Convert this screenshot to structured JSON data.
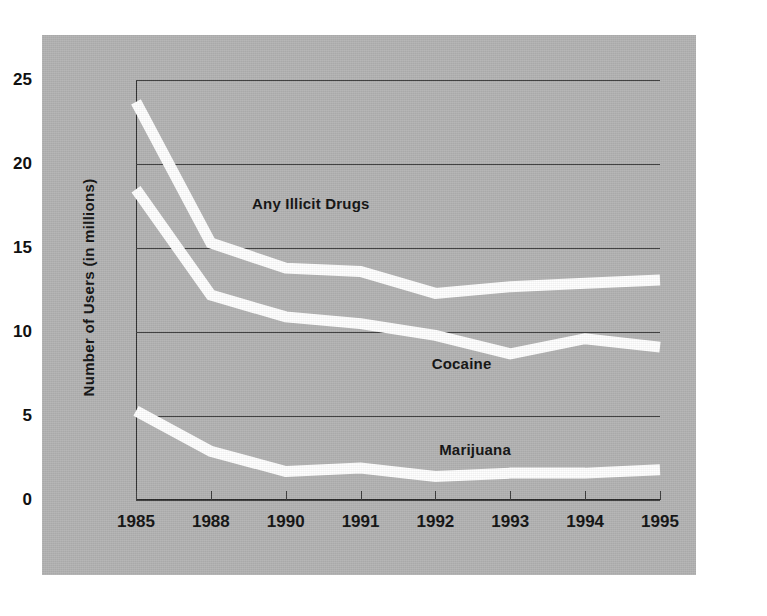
{
  "figure": {
    "background_color": "#b3b3b3",
    "line_color": "#ffffff",
    "axis_color": "#2b2b2b"
  },
  "chart_data": {
    "type": "line",
    "title": "",
    "xlabel": "",
    "ylabel": "Number of Users (in millions)",
    "categories": [
      "1985",
      "1988",
      "1990",
      "1991",
      "1992",
      "1993",
      "1994",
      "1995"
    ],
    "ylim": [
      0,
      25
    ],
    "yticks": [
      "0",
      "5",
      "10",
      "15",
      "20",
      "25"
    ],
    "ytick_values": [
      0,
      5,
      10,
      15,
      20,
      25
    ],
    "grid": true,
    "legend_position": "inline-annotations",
    "series": [
      {
        "name": "Any Illicit Drugs",
        "values": [
          23.7,
          15.3,
          13.8,
          13.6,
          12.3,
          12.7,
          12.9,
          13.1
        ]
      },
      {
        "name": "Cocaine",
        "values": [
          18.5,
          12.2,
          10.9,
          10.5,
          9.8,
          8.7,
          9.6,
          9.1
        ]
      },
      {
        "name": "Marijuana",
        "values": [
          5.3,
          2.9,
          1.7,
          1.9,
          1.4,
          1.6,
          1.6,
          1.8
        ]
      }
    ],
    "annotations": [
      {
        "text": "Any Illicit Drugs",
        "x_index": 1.55,
        "y_value": 17.6
      },
      {
        "text": "Cocaine",
        "x_index": 3.95,
        "y_value": 8.1
      },
      {
        "text": "Marijuana",
        "x_index": 4.05,
        "y_value": 3.0
      }
    ]
  }
}
